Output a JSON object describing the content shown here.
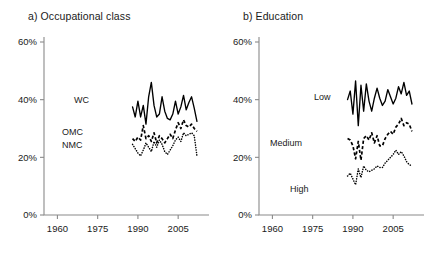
{
  "figure": {
    "background": "#ffffff",
    "panels": [
      {
        "id": "occupational-class",
        "title": "a) Occupational class",
        "labels": {
          "s1": "WC",
          "s2": "OMC",
          "s3": "NMC"
        }
      },
      {
        "id": "education",
        "title": "b) Education",
        "labels": {
          "s1": "Low",
          "s2": "Medium",
          "s3": "High"
        }
      }
    ]
  },
  "chart_data": [
    {
      "type": "line",
      "title": "a) Occupational class",
      "xlabel": "",
      "ylabel": "",
      "xlim": [
        1955,
        2015
      ],
      "ylim": [
        0,
        60
      ],
      "xticks": [
        1960,
        1975,
        1990,
        2005
      ],
      "yticks": [
        0,
        20,
        40,
        60
      ],
      "ytick_labels": [
        "0%",
        "20%",
        "40%",
        "60%"
      ],
      "xtick_labels": [
        "1960",
        "1975",
        "1990",
        "2005"
      ],
      "grid": false,
      "legend": "inline-labels",
      "series": [
        {
          "name": "WC",
          "style": "solid",
          "x": [
            1988,
            1989,
            1990,
            1991,
            1992,
            1993,
            1994,
            1995,
            1996,
            1997,
            1998,
            1999,
            2000,
            2001,
            2002,
            2003,
            2004,
            2005,
            2006,
            2007,
            2008,
            2009,
            2010,
            2011,
            2012
          ],
          "values": [
            37.5,
            34.0,
            39.5,
            34.0,
            38.0,
            31.5,
            41.0,
            46.0,
            38.0,
            34.0,
            35.0,
            41.0,
            36.0,
            33.5,
            33.0,
            35.0,
            39.5,
            35.0,
            37.5,
            41.5,
            36.5,
            39.0,
            41.0,
            37.0,
            32.5
          ]
        },
        {
          "name": "OMC",
          "style": "dashed",
          "x": [
            1988,
            1989,
            1990,
            1991,
            1992,
            1993,
            1994,
            1995,
            1996,
            1997,
            1998,
            1999,
            2000,
            2001,
            2002,
            2003,
            2004,
            2005,
            2006,
            2007,
            2008,
            2009,
            2010,
            2011,
            2012
          ],
          "values": [
            26.5,
            25.5,
            27.0,
            26.0,
            31.0,
            26.5,
            27.5,
            25.5,
            28.5,
            25.0,
            27.5,
            26.5,
            25.0,
            26.5,
            28.0,
            26.5,
            29.5,
            32.0,
            30.0,
            33.0,
            31.0,
            30.5,
            31.5,
            30.0,
            29.0
          ]
        },
        {
          "name": "NMC",
          "style": "dotted",
          "x": [
            1988,
            1989,
            1990,
            1991,
            1992,
            1993,
            1994,
            1995,
            1996,
            1997,
            1998,
            1999,
            2000,
            2001,
            2002,
            2003,
            2004,
            2005,
            2006,
            2007,
            2008,
            2009,
            2010,
            2011,
            2012
          ],
          "values": [
            24.5,
            23.0,
            21.5,
            20.5,
            22.5,
            25.0,
            23.5,
            22.0,
            25.5,
            23.5,
            26.0,
            24.5,
            22.0,
            21.0,
            22.5,
            24.0,
            26.0,
            27.0,
            25.5,
            28.5,
            27.5,
            28.0,
            28.5,
            27.5,
            20.5
          ]
        }
      ]
    },
    {
      "type": "line",
      "title": "b) Education",
      "xlabel": "",
      "ylabel": "",
      "xlim": [
        1955,
        2015
      ],
      "ylim": [
        0,
        60
      ],
      "xticks": [
        1960,
        1975,
        1990,
        2005
      ],
      "yticks": [
        0,
        20,
        40,
        60
      ],
      "ytick_labels": [
        "0%",
        "20%",
        "40%",
        "60%"
      ],
      "xtick_labels": [
        "1960",
        "1975",
        "1990",
        "2005"
      ],
      "grid": false,
      "legend": "inline-labels",
      "series": [
        {
          "name": "Low",
          "style": "solid",
          "x": [
            1988,
            1989,
            1990,
            1991,
            1992,
            1993,
            1994,
            1995,
            1996,
            1997,
            1998,
            1999,
            2000,
            2001,
            2002,
            2003,
            2004,
            2005,
            2006,
            2007,
            2008,
            2009,
            2010,
            2011,
            2012
          ],
          "values": [
            40.0,
            43.0,
            35.0,
            46.5,
            31.0,
            45.0,
            36.0,
            45.5,
            39.5,
            36.0,
            40.5,
            44.0,
            40.5,
            38.0,
            39.5,
            43.5,
            41.0,
            38.5,
            40.5,
            44.5,
            42.0,
            46.0,
            41.5,
            43.0,
            38.5
          ]
        },
        {
          "name": "Medium",
          "style": "dashed",
          "x": [
            1988,
            1989,
            1990,
            1991,
            1992,
            1993,
            1994,
            1995,
            1996,
            1997,
            1998,
            1999,
            2000,
            2001,
            2002,
            2003,
            2004,
            2005,
            2006,
            2007,
            2008,
            2009,
            2010,
            2011,
            2012
          ],
          "values": [
            26.5,
            26.0,
            24.0,
            19.5,
            25.5,
            19.0,
            26.5,
            27.5,
            26.0,
            28.5,
            25.0,
            27.5,
            24.0,
            24.0,
            26.5,
            28.0,
            29.0,
            28.0,
            30.5,
            31.5,
            33.5,
            31.0,
            32.0,
            31.5,
            29.0
          ]
        },
        {
          "name": "High",
          "style": "dotted",
          "x": [
            1988,
            1989,
            1990,
            1991,
            1992,
            1993,
            1994,
            1995,
            1996,
            1997,
            1998,
            1999,
            2000,
            2001,
            2002,
            2003,
            2004,
            2005,
            2006,
            2007,
            2008,
            2009,
            2010,
            2011,
            2012
          ],
          "values": [
            13.5,
            14.5,
            12.5,
            10.5,
            16.0,
            13.0,
            17.0,
            15.5,
            15.0,
            15.5,
            16.0,
            17.0,
            16.5,
            16.5,
            18.0,
            19.0,
            20.0,
            21.0,
            22.5,
            21.0,
            22.0,
            20.5,
            18.5,
            17.5,
            17.0
          ]
        }
      ]
    }
  ]
}
